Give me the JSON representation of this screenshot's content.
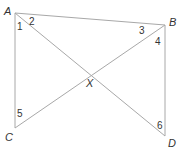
{
  "diagram": {
    "type": "geometry",
    "points": {
      "A": {
        "label": "A",
        "x": 15,
        "y": 13
      },
      "B": {
        "label": "B",
        "x": 165,
        "y": 25
      },
      "C": {
        "label": "C",
        "x": 15,
        "y": 128
      },
      "D": {
        "label": "D",
        "x": 165,
        "y": 136
      },
      "X": {
        "label": "X",
        "x": 90,
        "y": 74
      }
    },
    "segments": [
      {
        "name": "AB",
        "from": "A",
        "to": "B"
      },
      {
        "name": "AC",
        "from": "A",
        "to": "C"
      },
      {
        "name": "BD",
        "from": "B",
        "to": "D"
      },
      {
        "name": "AD",
        "from": "A",
        "to": "D"
      },
      {
        "name": "CB",
        "from": "C",
        "to": "B"
      }
    ],
    "angles": [
      {
        "label": "1",
        "at": "A"
      },
      {
        "label": "2",
        "at": "A"
      },
      {
        "label": "3",
        "at": "B"
      },
      {
        "label": "4",
        "at": "B"
      },
      {
        "label": "5",
        "at": "C"
      },
      {
        "label": "6",
        "at": "D"
      }
    ],
    "colors": {
      "line": "#a8a8a8",
      "text": "#333333"
    }
  }
}
